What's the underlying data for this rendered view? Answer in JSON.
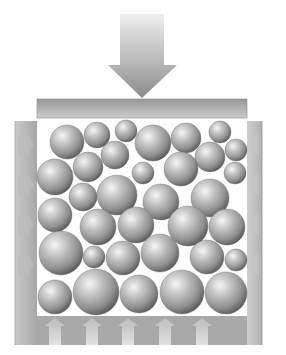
{
  "diagram": {
    "title": "",
    "components": {
      "force_arrow": {
        "label": "",
        "direction": "down",
        "shaft": {
          "x": 120,
          "y": 14,
          "w": 44,
          "h": 52
        },
        "head": {
          "left": 108,
          "right": 177,
          "top": 65,
          "tip_y": 98
        }
      },
      "piston": {
        "label": "",
        "x": 37,
        "y": 99,
        "w": 210,
        "h": 19
      },
      "container": {
        "label": "",
        "outer": {
          "x": 15,
          "y": 121,
          "w": 247,
          "h": 224
        },
        "inner": {
          "x": 37,
          "y": 122,
          "w": 210,
          "h": 194
        }
      },
      "reaction_arrows": {
        "label": "",
        "direction": "up",
        "centers_x": [
          55,
          92,
          128,
          165,
          202
        ],
        "y_top": 318,
        "y_bottom": 345
      }
    },
    "spheres": [
      {
        "cx": 67,
        "cy": 142,
        "r": 17
      },
      {
        "cx": 97,
        "cy": 135,
        "r": 13
      },
      {
        "cx": 126,
        "cy": 131,
        "r": 11
      },
      {
        "cx": 153,
        "cy": 143,
        "r": 18
      },
      {
        "cx": 186,
        "cy": 138,
        "r": 15
      },
      {
        "cx": 220,
        "cy": 132,
        "r": 11
      },
      {
        "cx": 236,
        "cy": 150,
        "r": 11
      },
      {
        "cx": 115,
        "cy": 155,
        "r": 14
      },
      {
        "cx": 88,
        "cy": 167,
        "r": 15
      },
      {
        "cx": 210,
        "cy": 157,
        "r": 15
      },
      {
        "cx": 181,
        "cy": 169,
        "r": 17
      },
      {
        "cx": 143,
        "cy": 173,
        "r": 11
      },
      {
        "cx": 235,
        "cy": 173,
        "r": 11
      },
      {
        "cx": 55,
        "cy": 177,
        "r": 18
      },
      {
        "cx": 83,
        "cy": 197,
        "r": 14
      },
      {
        "cx": 117,
        "cy": 195,
        "r": 20
      },
      {
        "cx": 161,
        "cy": 202,
        "r": 18
      },
      {
        "cx": 210,
        "cy": 198,
        "r": 19
      },
      {
        "cx": 55,
        "cy": 215,
        "r": 17
      },
      {
        "cx": 98,
        "cy": 227,
        "r": 18
      },
      {
        "cx": 136,
        "cy": 225,
        "r": 18
      },
      {
        "cx": 188,
        "cy": 226,
        "r": 20
      },
      {
        "cx": 227,
        "cy": 227,
        "r": 18
      },
      {
        "cx": 61,
        "cy": 253,
        "r": 22
      },
      {
        "cx": 94,
        "cy": 257,
        "r": 11
      },
      {
        "cx": 123,
        "cy": 258,
        "r": 17
      },
      {
        "cx": 160,
        "cy": 253,
        "r": 19
      },
      {
        "cx": 207,
        "cy": 257,
        "r": 17
      },
      {
        "cx": 236,
        "cy": 260,
        "r": 11
      },
      {
        "cx": 55,
        "cy": 297,
        "r": 17
      },
      {
        "cx": 96,
        "cy": 292,
        "r": 23
      },
      {
        "cx": 139,
        "cy": 294,
        "r": 19
      },
      {
        "cx": 182,
        "cy": 292,
        "r": 22
      },
      {
        "cx": 226,
        "cy": 293,
        "r": 21
      }
    ],
    "colors": {
      "background": "#ffffff",
      "arrow_top": "#eaeaea",
      "arrow_bottom": "#8a8a8a",
      "piston_top": "#9a9a9a",
      "piston_bottom": "#c9c9c9",
      "wall": "#b4b4b4",
      "wall_dark": "#9e9e9e",
      "wall_light": "#d2d2d2",
      "sphere_highlight": "#f4f4f4",
      "sphere_mid": "#a6a6a6",
      "sphere_shadow": "#555555",
      "reaction_arrow": "#d0d0d0"
    }
  }
}
